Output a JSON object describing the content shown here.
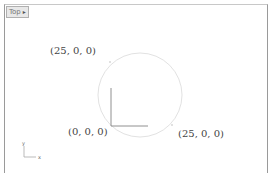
{
  "viewport": {
    "name": "Top",
    "menu_icon": "dropdown-arrow-icon"
  },
  "annotations": [
    {
      "text": "(25, 0, 0)",
      "x": 50,
      "y": 45
    },
    {
      "text": "(0, 0, 0)",
      "x": 68,
      "y": 126
    },
    {
      "text": "(25, 0, 0)",
      "x": 178,
      "y": 128
    }
  ],
  "circle": {
    "cx": 140,
    "cy": 95,
    "r": 42,
    "color": "#e2e2e2"
  },
  "cplane_axes": {
    "color": "#909090"
  },
  "world_axes": {
    "x_label": "x",
    "y_label": "y"
  }
}
